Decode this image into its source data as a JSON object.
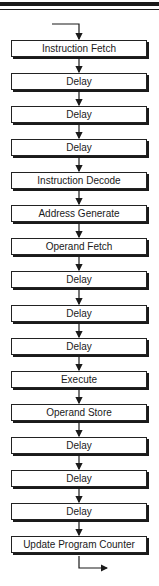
{
  "diagram": {
    "type": "flowchart",
    "direction": "top-to-bottom",
    "colors": {
      "ink": "#1a1a1a",
      "background": "#ffffff"
    },
    "steps": [
      {
        "label": "Instruction Fetch"
      },
      {
        "label": "Delay"
      },
      {
        "label": "Delay"
      },
      {
        "label": "Delay"
      },
      {
        "label": "Instruction Decode"
      },
      {
        "label": "Address Generate"
      },
      {
        "label": "Operand Fetch"
      },
      {
        "label": "Delay"
      },
      {
        "label": "Delay"
      },
      {
        "label": "Delay"
      },
      {
        "label": "Execute"
      },
      {
        "label": "Operand Store"
      },
      {
        "label": "Delay"
      },
      {
        "label": "Delay"
      },
      {
        "label": "Delay"
      },
      {
        "label": "Update Program Counter"
      }
    ],
    "entry_arrow": "left-to-down into first step",
    "exit_arrow": "down-to-right out of last step"
  }
}
